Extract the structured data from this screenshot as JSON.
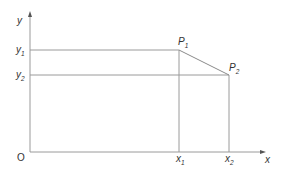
{
  "diagram": {
    "axes": {
      "x_label": "x",
      "y_label": "y",
      "origin_label": "O"
    },
    "y_ticks": [
      {
        "base": "y",
        "sub": "1"
      },
      {
        "base": "y",
        "sub": "2"
      }
    ],
    "x_ticks": [
      {
        "base": "x",
        "sub": "1"
      },
      {
        "base": "x",
        "sub": "2"
      }
    ],
    "points": [
      {
        "base": "P",
        "sub": "1"
      },
      {
        "base": "P",
        "sub": "2"
      }
    ],
    "colors": {
      "line": "#9a9a9a",
      "text": "#333333"
    }
  }
}
